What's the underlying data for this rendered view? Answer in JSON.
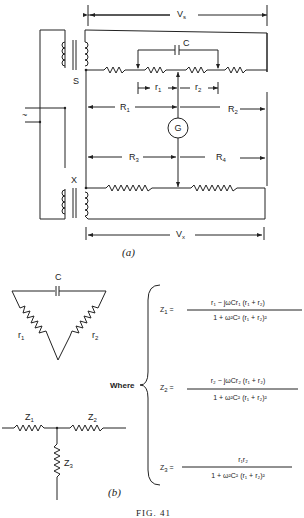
{
  "figure": {
    "caption": "FIG. 41",
    "panel_a_label": "(a)",
    "panel_b_label": "(b)"
  },
  "panel_a": {
    "voltage_top": "V",
    "voltage_top_sub": "s",
    "voltage_bottom": "V",
    "voltage_bottom_sub": "x",
    "transformer_top": "S",
    "transformer_bottom": "X",
    "capacitor": "C",
    "galvanometer": "G",
    "ac_source": "~",
    "r1": "r",
    "r1_sub": "1",
    "r2": "r",
    "r2_sub": "2",
    "R1": "R",
    "R1_sub": "1",
    "R2": "R",
    "R2_sub": "2",
    "R3": "R",
    "R3_sub": "3",
    "R4": "R",
    "R4_sub": "4"
  },
  "panel_b": {
    "delta": {
      "capacitor": "C",
      "r1": "r",
      "r1_sub": "1",
      "r2": "r",
      "r2_sub": "2"
    },
    "tee": {
      "z1": "Z",
      "z1_sub": "1",
      "z2": "Z",
      "z2_sub": "2",
      "z3": "Z",
      "z3_sub": "3"
    },
    "where_label": "Where",
    "equations": [
      {
        "lhs": "Z",
        "lhs_sub": "1",
        "numerator": "r₁ − jωCr₁ (r₁ + r₂)",
        "denominator": "1 + ω²C² (r₁ + r₂)²"
      },
      {
        "lhs": "Z",
        "lhs_sub": "2",
        "numerator": "r₂ − jωCr₂ (r₁ + r₂)",
        "denominator": "1 + ω²C² (r₁ + r₂)²"
      },
      {
        "lhs": "Z",
        "lhs_sub": "3",
        "numerator": "r₁r₂",
        "denominator": "1 + ω²C² (r₁ + r₂)²"
      }
    ]
  }
}
